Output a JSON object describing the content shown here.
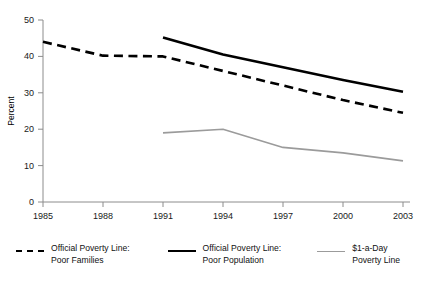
{
  "chart_data": {
    "type": "line",
    "title": "",
    "xlabel": "",
    "ylabel": "Percent",
    "x": [
      1985,
      1988,
      1991,
      1994,
      1997,
      2000,
      2003
    ],
    "xticklabels": [
      "1985",
      "1988",
      "1991",
      "1994",
      "1997",
      "2000",
      "2003"
    ],
    "yticks": [
      0,
      10,
      20,
      30,
      40,
      50
    ],
    "yticklabels": [
      "0",
      "10",
      "20",
      "30",
      "40",
      "50"
    ],
    "ylim": [
      0,
      50
    ],
    "grid": false,
    "legend_position": "bottom",
    "series": [
      {
        "name": "Official Poverty Line: Poor Families",
        "style": "dashed",
        "color": "#000000",
        "x": [
          1985,
          1988,
          1991,
          1994,
          1997,
          2000,
          2003
        ],
        "values": [
          44.0,
          40.2,
          40.0,
          36.0,
          32.0,
          28.0,
          24.5
        ]
      },
      {
        "name": "Official Poverty Line: Poor Population",
        "style": "solid",
        "color": "#000000",
        "x": [
          1991,
          1994,
          1997,
          2000,
          2003
        ],
        "values": [
          45.2,
          40.5,
          37.0,
          33.5,
          30.3
        ]
      },
      {
        "name": "$1-a-Day Poverty Line",
        "style": "solid-thin",
        "color": "#9b9b9b",
        "x": [
          1991,
          1994,
          1997,
          2000,
          2003
        ],
        "values": [
          19.0,
          20.0,
          15.0,
          13.5,
          11.3
        ]
      }
    ]
  },
  "axis": {
    "ylabel": "Percent",
    "ytick_0": "0",
    "ytick_1": "10",
    "ytick_2": "20",
    "ytick_3": "30",
    "ytick_4": "40",
    "ytick_5": "50",
    "xtick_0": "1985",
    "xtick_1": "1988",
    "xtick_2": "1991",
    "xtick_3": "1994",
    "xtick_4": "1997",
    "xtick_5": "2000",
    "xtick_6": "2003"
  },
  "legend": {
    "items": [
      {
        "label": "Official Poverty Line:\nPoor Families",
        "marker": "dashed-line-icon",
        "color": "#000000"
      },
      {
        "label": "Official Poverty Line:\nPoor Population",
        "marker": "solid-line-icon",
        "color": "#000000"
      },
      {
        "label": "$1-a-Day\nPoverty Line",
        "marker": "gray-line-icon",
        "color": "#9b9b9b"
      }
    ]
  },
  "colors": {
    "axis": "#8c8c8c",
    "text": "#111111",
    "series_black": "#000000",
    "series_gray": "#9b9b9b",
    "background": "#ffffff"
  }
}
